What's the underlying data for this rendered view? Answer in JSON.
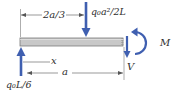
{
  "diagram": {
    "type": "free-body-diagram",
    "colors": {
      "beam_fill": "#c8c8c8",
      "beam_stroke": "#7a7a7a",
      "force_arrow": "#3f5fb0",
      "dimension_line": "#555555",
      "text": "#2e2e2e"
    },
    "labels": {
      "dim_top": "2a/3",
      "point_load": "q₀a²/2L",
      "moment": "M",
      "shear": "V",
      "dim_x": "x",
      "dim_a": "a",
      "reaction": "q₀L/6"
    },
    "forces": [
      {
        "name": "reaction",
        "label": "q₀L/6",
        "direction": "up",
        "location": "left end"
      },
      {
        "name": "point-load",
        "label": "q₀a²/2L",
        "direction": "down",
        "location": "2a/3 from left end"
      },
      {
        "name": "shear",
        "label": "V",
        "direction": "down",
        "location": "cut section"
      },
      {
        "name": "moment",
        "label": "M",
        "direction": "counterclockwise",
        "location": "cut section"
      }
    ],
    "dimensions": [
      {
        "label": "2a/3",
        "from": "left end",
        "to": "point load"
      },
      {
        "label": "x",
        "from": "left end",
        "to": "cut"
      },
      {
        "label": "a",
        "from": "left end",
        "to": "cut"
      }
    ]
  }
}
